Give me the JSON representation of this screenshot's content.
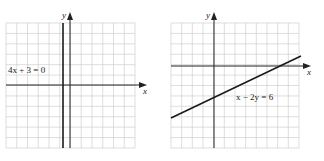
{
  "chart_data": [
    {
      "type": "line",
      "title": "",
      "xlabel": "x",
      "ylabel": "y",
      "grid": true,
      "xlim": [
        -6,
        6
      ],
      "ylim": [
        -6,
        6
      ],
      "series": [
        {
          "name": "4x + 3 = 0",
          "equation": "4x + 3 = 0",
          "x": [
            -0.75,
            -0.75
          ],
          "y": [
            -6,
            6
          ]
        }
      ],
      "annotations": [
        {
          "text": "4x + 3 = 0",
          "position": "upper-left, beside line"
        }
      ]
    },
    {
      "type": "line",
      "title": "",
      "xlabel": "x",
      "ylabel": "y",
      "grid": true,
      "xlim": [
        -4,
        8
      ],
      "ylim": [
        -7,
        4
      ],
      "series": [
        {
          "name": "x - 2y = 6",
          "equation": "x - 2y = 6",
          "x": [
            -4,
            8
          ],
          "y": [
            -5,
            1
          ]
        }
      ],
      "annotations": [
        {
          "text": "x − 2y = 6",
          "position": "below line, right of y-axis"
        }
      ]
    }
  ],
  "left": {
    "equation_label": "4x + 3 = 0",
    "x_axis_label": "x",
    "y_axis_label": "y"
  },
  "right": {
    "equation_label": "x − 2y = 6",
    "x_axis_label": "x",
    "y_axis_label": "y"
  }
}
